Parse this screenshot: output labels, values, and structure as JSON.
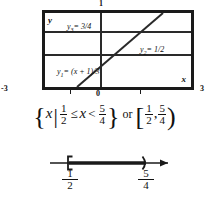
{
  "graph": {
    "window_title": "graphing-calculator-window",
    "axis_labels": {
      "y": "y",
      "x": "x"
    },
    "ticks": {
      "top": "1",
      "left": "-3",
      "right": "3",
      "origin": "0"
    },
    "functions": [
      {
        "name": "y1",
        "sub": "1",
        "label_lhs": "y",
        "label_rhs": "= (x + 1)/3",
        "expression": "y1 = (x+1)/3",
        "type": "line",
        "slope": 0.3333,
        "intercept": 0.3333
      },
      {
        "name": "y2",
        "sub": "2",
        "label_lhs": "y",
        "label_rhs": "= 1/2",
        "expression": "y2 = 1/2",
        "type": "horizontal",
        "value": 0.5
      },
      {
        "name": "y3",
        "sub": "3",
        "label_lhs": "y",
        "label_rhs": "= 3/4",
        "expression": "y3 = 3/4",
        "type": "horizontal",
        "value": 0.75
      }
    ],
    "x_range": [
      -3,
      3
    ],
    "y_range": [
      -1,
      1
    ]
  },
  "solution": {
    "open_brace": "{",
    "variable": "x",
    "such_that": "|",
    "lower_num": "1",
    "lower_den": "2",
    "rel_left": "≤",
    "var_middle": "x",
    "rel_right": "<",
    "upper_num": "5",
    "upper_den": "4",
    "close_brace": "}",
    "connector": "or",
    "open_bracket": "[",
    "int_lower_num": "1",
    "int_lower_den": "2",
    "comma": ",",
    "int_upper_num": "5",
    "int_upper_den": "4",
    "close_paren": ")",
    "full_text": "{x | 1/2 ≤ x < 5/4} or [1/2, 5/4)"
  },
  "numberline": {
    "left_endpoint": {
      "num": "1",
      "den": "2",
      "type": "closed-bracket",
      "glyph": "["
    },
    "right_endpoint": {
      "num": "5",
      "den": "4",
      "type": "open-paren",
      "glyph": ")"
    },
    "shaded": true,
    "arrow_direction": "right"
  },
  "colors": {
    "ink": "#1a1a1a",
    "line": "#2a2a2a",
    "background": "#ffffff"
  }
}
